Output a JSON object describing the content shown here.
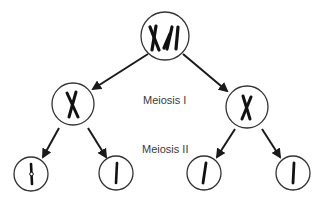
{
  "diagram": {
    "title": "Meiosis",
    "stages": [
      {
        "label": "Meiosis I"
      },
      {
        "label": "Meiosis II"
      }
    ],
    "cells": [
      {
        "id": "parent",
        "content": "two homologous chromosome pairs (X shapes)"
      },
      {
        "id": "meiosis1-left",
        "content": "one chromosome (X shape)"
      },
      {
        "id": "meiosis1-right",
        "content": "one chromosome (X shape)"
      },
      {
        "id": "meiosis2-1",
        "content": "single chromatid"
      },
      {
        "id": "meiosis2-2",
        "content": "single chromatid"
      },
      {
        "id": "meiosis2-3",
        "content": "single chromatid"
      },
      {
        "id": "meiosis2-4",
        "content": "single chromatid"
      }
    ],
    "colors": {
      "stroke": "#1a1a1a",
      "circle": "#333333",
      "text": "#3a3a3a",
      "background": "#ffffff"
    }
  }
}
